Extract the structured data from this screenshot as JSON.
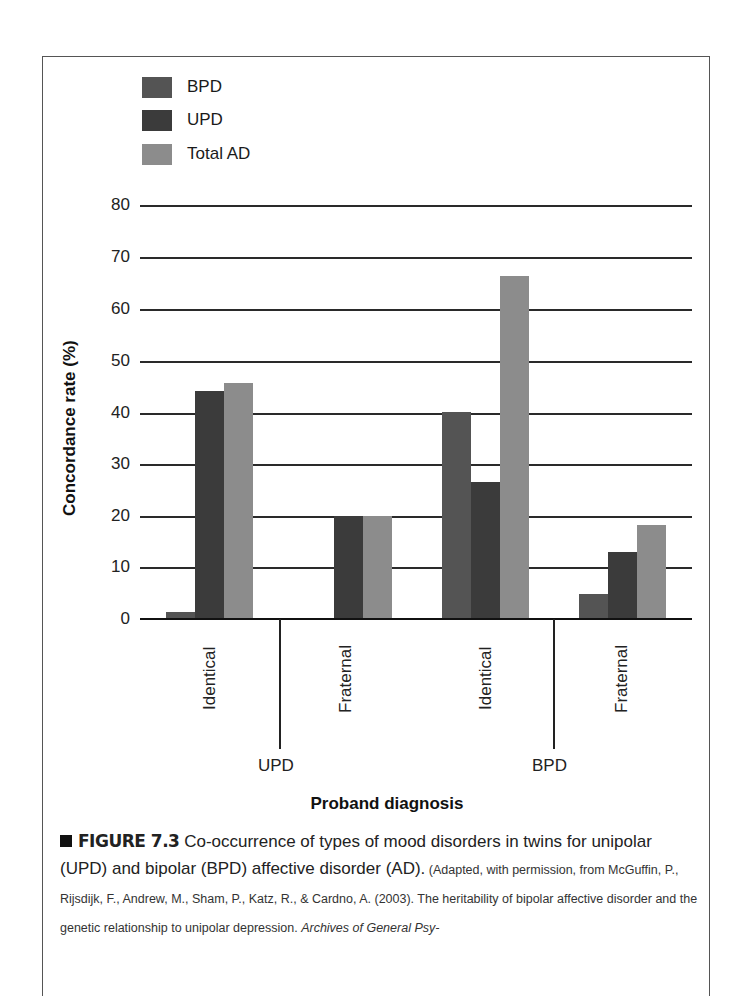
{
  "chart_data": {
    "type": "bar",
    "title": "",
    "xlabel": "Proband diagnosis",
    "ylabel": "Concordance rate (%)",
    "ylim": [
      0,
      80
    ],
    "yticks": [
      0,
      10,
      20,
      30,
      40,
      50,
      60,
      70,
      80
    ],
    "grid": true,
    "legend_position": "top-left",
    "categories": [
      "UPD Identical",
      "UPD Fraternal",
      "BPD Identical",
      "BPD Fraternal"
    ],
    "category_groups": [
      {
        "group": "UPD",
        "subcategories": [
          "Identical",
          "Fraternal"
        ]
      },
      {
        "group": "BPD",
        "subcategories": [
          "Identical",
          "Fraternal"
        ]
      }
    ],
    "series": [
      {
        "name": "BPD",
        "color": "#545454",
        "values": [
          1.4,
          0,
          40,
          4.8
        ]
      },
      {
        "name": "UPD",
        "color": "#3b3b3b",
        "values": [
          44.1,
          20,
          26.5,
          13
        ]
      },
      {
        "name": "Total AD",
        "color": "#8c8c8c",
        "values": [
          45.6,
          20,
          66.3,
          18.2
        ]
      }
    ]
  },
  "legend": [
    {
      "label": "BPD",
      "color": "#545454"
    },
    {
      "label": "UPD",
      "color": "#3b3b3b"
    },
    {
      "label": "Total AD",
      "color": "#8c8c8c"
    }
  ],
  "axis": {
    "ylabel": "Concordance rate (%)",
    "xlabel": "Proband diagnosis",
    "ticks": [
      "80",
      "70",
      "60",
      "50",
      "40",
      "30",
      "20",
      "10",
      "0"
    ],
    "subcategory_labels": [
      "Identical",
      "Fraternal",
      "Identical",
      "Fraternal"
    ],
    "group_labels": [
      "UPD",
      "BPD"
    ]
  },
  "caption": {
    "figure_number": "FIGURE 7.3",
    "text": " Co-occurrence of types of mood disorders in twins for unipolar (UPD) and bipolar (BPD) affective disorder (AD).",
    "source_prefix": " (Adapted, with permission, from McGuffin, P., Rijsdijk, F., Andrew, M., Sham, P., Katz, R., & Cardno, A. (2003). The heritability of bipolar affective disorder and the genetic relationship to unipolar depression. ",
    "source_journal": "Archives of General Psy-"
  }
}
